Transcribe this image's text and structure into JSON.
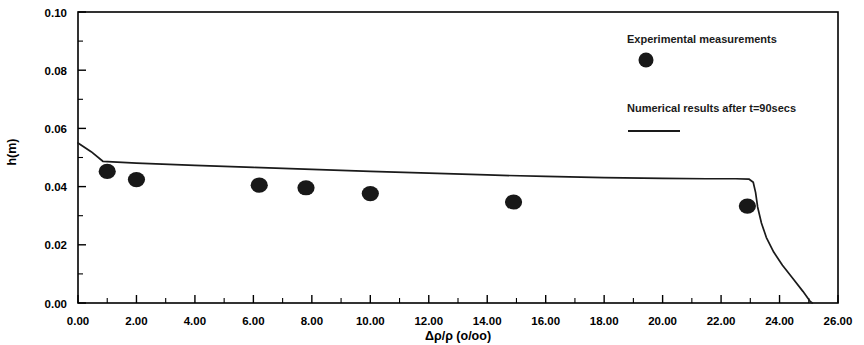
{
  "chart_data": {
    "type": "scatter",
    "title": "",
    "xlabel": "Δρ/ρ (o/oo)",
    "ylabel": "h(m)",
    "xlim": [
      0,
      26
    ],
    "ylim": [
      0,
      0.1
    ],
    "xticks": [
      0,
      2,
      4,
      6,
      8,
      10,
      12,
      14,
      16,
      18,
      20,
      22,
      24,
      26
    ],
    "xtick_labels": [
      "0.00",
      "2.00",
      "4.00",
      "6.00",
      "8.00",
      "10.00",
      "12.00",
      "14.00",
      "16.00",
      "18.00",
      "20.00",
      "22.00",
      "24.00",
      "26.00"
    ],
    "yticks": [
      0.0,
      0.02,
      0.04,
      0.06,
      0.08,
      0.1
    ],
    "ytick_labels": [
      "0.00",
      "0.02",
      "0.04",
      "0.06",
      "0.08",
      "0.10"
    ],
    "xminor_step": 1,
    "yminor_step": 0.01,
    "grid": false,
    "legend_position": "upper-right-inside",
    "series": [
      {
        "name": "Experimental measurements",
        "kind": "scatter",
        "marker": "filled-circle",
        "color": "#181818",
        "points": [
          {
            "x": 1.0,
            "y": 0.0452
          },
          {
            "x": 2.0,
            "y": 0.0424
          },
          {
            "x": 6.2,
            "y": 0.0405
          },
          {
            "x": 7.8,
            "y": 0.0396
          },
          {
            "x": 10.0,
            "y": 0.0376
          },
          {
            "x": 14.9,
            "y": 0.0347
          },
          {
            "x": 22.9,
            "y": 0.0333
          }
        ]
      },
      {
        "name": "Numerical results after t=90secs",
        "kind": "line",
        "color": "#1a1a1a",
        "points": [
          {
            "x": 0.0,
            "y": 0.055
          },
          {
            "x": 0.45,
            "y": 0.052
          },
          {
            "x": 0.85,
            "y": 0.0487
          },
          {
            "x": 2.0,
            "y": 0.0481
          },
          {
            "x": 4.0,
            "y": 0.0473
          },
          {
            "x": 6.0,
            "y": 0.0466
          },
          {
            "x": 8.0,
            "y": 0.0459
          },
          {
            "x": 10.0,
            "y": 0.0452
          },
          {
            "x": 12.0,
            "y": 0.0446
          },
          {
            "x": 14.0,
            "y": 0.044
          },
          {
            "x": 16.0,
            "y": 0.0435
          },
          {
            "x": 18.0,
            "y": 0.0431
          },
          {
            "x": 20.0,
            "y": 0.0428
          },
          {
            "x": 21.5,
            "y": 0.0427
          },
          {
            "x": 22.5,
            "y": 0.0427
          },
          {
            "x": 22.95,
            "y": 0.0426
          },
          {
            "x": 23.1,
            "y": 0.0415
          },
          {
            "x": 23.18,
            "y": 0.038
          },
          {
            "x": 23.25,
            "y": 0.033
          },
          {
            "x": 23.38,
            "y": 0.0275
          },
          {
            "x": 23.55,
            "y": 0.0225
          },
          {
            "x": 23.8,
            "y": 0.0175
          },
          {
            "x": 24.1,
            "y": 0.013
          },
          {
            "x": 24.45,
            "y": 0.0085
          },
          {
            "x": 24.8,
            "y": 0.004
          },
          {
            "x": 25.05,
            "y": 0.0005
          },
          {
            "x": 25.12,
            "y": 0.0
          }
        ]
      }
    ]
  },
  "legend": {
    "entries": [
      {
        "label": "Experimental measurements",
        "marker": "filled-circle"
      },
      {
        "label": "Numerical results after t=90secs",
        "marker": "line"
      }
    ]
  }
}
